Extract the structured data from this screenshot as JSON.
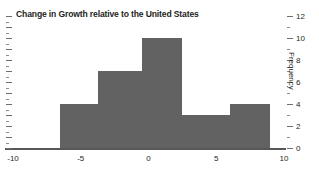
{
  "chart_data": {
    "type": "bar",
    "title": "Change in Growth relative to the United States",
    "xlabel": "",
    "ylabel": "Frequency",
    "xlim": [
      -10,
      10
    ],
    "ylim": [
      0,
      12
    ],
    "grid": false,
    "legend": null,
    "bar_color": "#626262",
    "xticks": [
      -10,
      -5,
      0,
      5,
      10
    ],
    "xtick_labels": [
      "-10",
      "-5",
      "0",
      "5",
      "10"
    ],
    "yticks": [
      0,
      2,
      4,
      6,
      8,
      10,
      12
    ],
    "ytick_labels": [
      "0",
      "2",
      "4",
      "6",
      "8",
      "10",
      "12"
    ],
    "yticks_minor": [
      1,
      3,
      5,
      7,
      9,
      11
    ],
    "bins": [
      {
        "x0": -6.5,
        "x1": -3.75,
        "value": 4
      },
      {
        "x0": -3.75,
        "x1": -0.5,
        "value": 7
      },
      {
        "x0": -0.5,
        "x1": 2.5,
        "value": 10
      },
      {
        "x0": 2.5,
        "x1": 6.0,
        "value": 3
      },
      {
        "x0": 6.0,
        "x1": 9.0,
        "value": 4
      }
    ],
    "categories": [
      "-6.5 to -3.75",
      "-3.75 to -0.5",
      "-0.5 to 2.5",
      "2.5 to 6.0",
      "6.0 to 9.0"
    ],
    "values": [
      4,
      7,
      10,
      3,
      4
    ]
  }
}
